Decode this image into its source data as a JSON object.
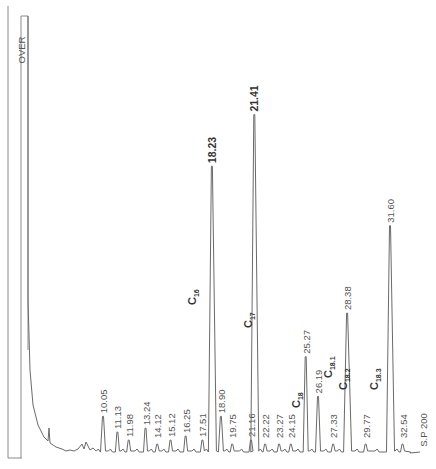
{
  "chart_data": {
    "type": "line",
    "title": "",
    "xlabel": "",
    "ylabel": "",
    "orientation": "retention time increases left to right, labels rotated 90 degrees",
    "overflow_label": "OVER",
    "end_label": "S.P 200",
    "peaks": [
      {
        "rt": 10.05,
        "height": 0.09,
        "label": "10.05"
      },
      {
        "rt": 11.13,
        "height": 0.05,
        "label": "11.13"
      },
      {
        "rt": 11.98,
        "height": 0.03,
        "label": "11.98"
      },
      {
        "rt": 13.24,
        "height": 0.06,
        "label": "13.24"
      },
      {
        "rt": 14.12,
        "height": 0.02,
        "label": "14.12"
      },
      {
        "rt": 15.12,
        "height": 0.03,
        "label": "15.12"
      },
      {
        "rt": 16.25,
        "height": 0.04,
        "label": "16.25"
      },
      {
        "rt": 17.51,
        "height": 0.03,
        "label": "17.51"
      },
      {
        "rt": 18.23,
        "height": 0.72,
        "label": "18.23",
        "bold": true
      },
      {
        "rt": 18.9,
        "height": 0.09,
        "label": "18.90"
      },
      {
        "rt": 19.75,
        "height": 0.02,
        "label": "19.75"
      },
      {
        "rt": 21.16,
        "height": 0.03,
        "label": "21.16"
      },
      {
        "rt": 21.41,
        "height": 0.85,
        "label": "21.41",
        "bold": true
      },
      {
        "rt": 22.22,
        "height": 0.02,
        "label": "22.22"
      },
      {
        "rt": 23.27,
        "height": 0.02,
        "label": "23.27"
      },
      {
        "rt": 24.15,
        "height": 0.02,
        "label": "24.15"
      },
      {
        "rt": 25.27,
        "height": 0.24,
        "label": "25.27"
      },
      {
        "rt": 26.19,
        "height": 0.14,
        "label": "26.19"
      },
      {
        "rt": 27.33,
        "height": 0.02,
        "label": "27.33"
      },
      {
        "rt": 28.38,
        "height": 0.35,
        "label": "28.38"
      },
      {
        "rt": 29.77,
        "height": 0.02,
        "label": "29.77"
      },
      {
        "rt": 31.6,
        "height": 0.57,
        "label": "31.60"
      },
      {
        "rt": 32.54,
        "height": 0.02,
        "label": "32.54"
      }
    ],
    "annotations": [
      {
        "text": "C",
        "sub": "16",
        "near_rt": 17.0
      },
      {
        "text": "C",
        "sub": "17",
        "near_rt": 20.6
      },
      {
        "text": "C",
        "sub": "18",
        "near_rt": 24.0
      },
      {
        "text": "C",
        "sub": "18.1",
        "near_rt": 26.4
      },
      {
        "text": "C",
        "sub": "18.2",
        "near_rt": 27.6
      },
      {
        "text": "C",
        "sub": "18.3",
        "near_rt": 30.6
      }
    ],
    "solvent_front": {
      "label": "OVER",
      "off_scale": true
    },
    "grid": false,
    "legend": null
  },
  "colors": {
    "trace": "#6a6a6a",
    "frame": "#8a8a8a",
    "text": "#555555"
  }
}
